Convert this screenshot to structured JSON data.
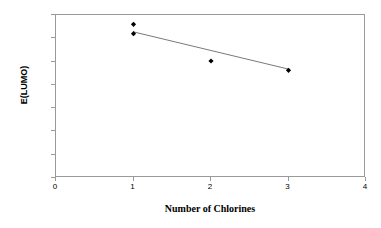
{
  "chart_data": {
    "type": "scatter",
    "title": "",
    "xlabel": "Number of Chlorines",
    "ylabel": "E(LUMO)",
    "xlim": [
      0,
      4
    ],
    "ylim": [
      0,
      0.14
    ],
    "xticks": [
      "0",
      "1",
      "2",
      "3",
      "4"
    ],
    "xtick_values": [
      0,
      1,
      2,
      3,
      4
    ],
    "yticks": [
      "0.00",
      "0.02",
      "0.04",
      "0.06",
      "0.08",
      "0.10",
      "0.12",
      "0.14"
    ],
    "ytick_values": [
      0.0,
      0.02,
      0.04,
      0.06,
      0.08,
      0.1,
      0.12,
      0.14
    ],
    "grid": false,
    "legend": "none",
    "series": [
      {
        "name": "E(LUMO)",
        "marker": "filled-diamond",
        "color": "#000000",
        "points": [
          {
            "x": 1,
            "y": 0.132
          },
          {
            "x": 1,
            "y": 0.124
          },
          {
            "x": 2,
            "y": 0.1005
          },
          {
            "x": 3,
            "y": 0.0925
          }
        ]
      }
    ],
    "trendline": {
      "name": "linear-fit",
      "color": "#7a7a7a",
      "x0": 1,
      "y0": 0.1255,
      "x1": 3,
      "y1": 0.0935
    },
    "frame_color": "#9a9a9a",
    "background": "#ffffff"
  }
}
